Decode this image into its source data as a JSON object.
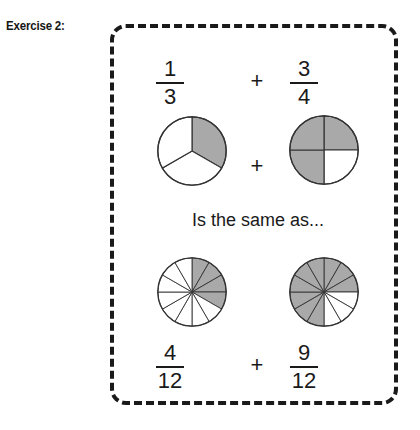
{
  "exercise": {
    "label": "Exercise 2:"
  },
  "panel": {
    "connector_top": "+",
    "connector_middle": "+",
    "connector_bottom": "+",
    "same_as_text": "Is the same as..."
  },
  "colors": {
    "shaded": "#a9a9a9",
    "unshaded": "#ffffff",
    "outline": "#333333",
    "text": "#1a1a1a",
    "border": "#1a1a1a"
  },
  "top_row": {
    "left": {
      "numerator": "1",
      "denominator": "3",
      "pie": {
        "slices": 3,
        "shaded": 1,
        "shaded_indices": [
          0
        ]
      }
    },
    "right": {
      "numerator": "3",
      "denominator": "4",
      "pie": {
        "slices": 4,
        "shaded": 3,
        "shaded_indices": [
          0,
          2,
          3
        ]
      }
    }
  },
  "bottom_row": {
    "left": {
      "numerator": "4",
      "denominator": "12",
      "pie": {
        "slices": 12,
        "shaded": 4,
        "shaded_indices": [
          0,
          1,
          2,
          3
        ]
      }
    },
    "right": {
      "numerator": "9",
      "denominator": "12",
      "pie": {
        "slices": 12,
        "shaded": 9,
        "shaded_indices": [
          0,
          1,
          2,
          6,
          7,
          8,
          9,
          10,
          11
        ]
      }
    }
  }
}
